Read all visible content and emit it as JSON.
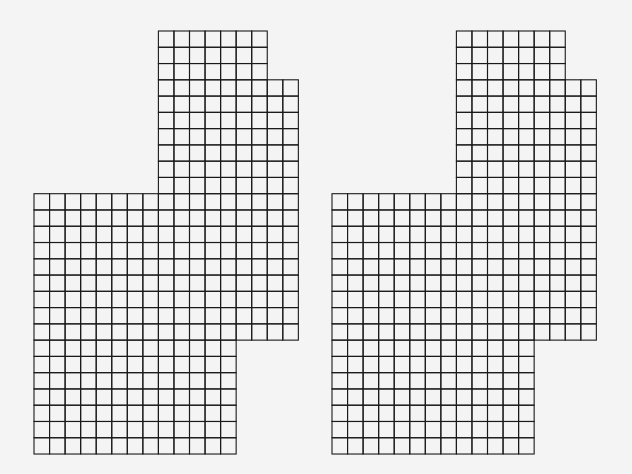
{
  "diagram": {
    "line_color": "#1a1a1a",
    "background_color": "#f4f4f4",
    "cell_width": 15.55,
    "cell_height": 16.27,
    "figures": [
      {
        "name": "left-grid-figure",
        "origin_x": 34,
        "origin_y": 31,
        "row_spans": [
          {
            "rows": [
              0,
              2
            ],
            "cols": [
              8,
              14
            ]
          },
          {
            "rows": [
              3,
              9
            ],
            "cols": [
              8,
              16
            ]
          },
          {
            "rows": [
              10,
              18
            ],
            "cols": [
              0,
              16
            ]
          },
          {
            "rows": [
              19,
              25
            ],
            "cols": [
              0,
              12
            ]
          }
        ]
      },
      {
        "name": "right-grid-figure",
        "origin_x": 332,
        "origin_y": 31,
        "row_spans": [
          {
            "rows": [
              0,
              2
            ],
            "cols": [
              8,
              14
            ]
          },
          {
            "rows": [
              3,
              9
            ],
            "cols": [
              8,
              16
            ]
          },
          {
            "rows": [
              10,
              18
            ],
            "cols": [
              0,
              16
            ]
          },
          {
            "rows": [
              19,
              25
            ],
            "cols": [
              0,
              12
            ]
          }
        ]
      }
    ]
  }
}
